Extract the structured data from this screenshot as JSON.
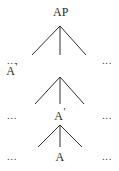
{
  "diagram": {
    "kind": "syntax-tree",
    "width": 119,
    "height": 171,
    "background_color": "#ffffff",
    "text_color": "#2b2b2b",
    "line_color": "#2f2f2f",
    "nodes": [
      {
        "id": "ap",
        "label": "AP",
        "base": "AP",
        "prime": "",
        "x": 61,
        "y": 13
      },
      {
        "id": "a-bar-left",
        "label": "A'",
        "base": "A",
        "prime": "'",
        "x": 12,
        "y": 72
      },
      {
        "id": "a-bar-mid",
        "label": "A'",
        "base": "A",
        "prime": "'",
        "x": 60,
        "y": 117
      },
      {
        "id": "a-head",
        "label": "A",
        "base": "A",
        "prime": "",
        "x": 60,
        "y": 158
      }
    ],
    "ellipses": [
      {
        "id": "ellipsis-left-row1",
        "label": "...",
        "x": 12,
        "y": 61
      },
      {
        "id": "ellipsis-right-row1",
        "label": "...",
        "x": 107,
        "y": 61
      },
      {
        "id": "ellipsis-left-row2",
        "label": "...",
        "x": 12,
        "y": 116
      },
      {
        "id": "ellipsis-right-row2",
        "label": "...",
        "x": 107,
        "y": 116
      },
      {
        "id": "ellipsis-left-row3",
        "label": "...",
        "x": 12,
        "y": 157
      },
      {
        "id": "ellipsis-right-row3",
        "label": "...",
        "x": 107,
        "y": 157
      }
    ],
    "branch_groups": [
      {
        "id": "branch-group-top",
        "apex_x": 60,
        "apex_y": 26,
        "left_x": 32,
        "right_x": 86,
        "bottom_y": 55
      },
      {
        "id": "branch-group-middle",
        "apex_x": 60,
        "apex_y": 77,
        "left_x": 35,
        "right_x": 84,
        "bottom_y": 104
      },
      {
        "id": "branch-group-bottom",
        "apex_x": 60,
        "apex_y": 125,
        "left_x": 38,
        "right_x": 82,
        "bottom_y": 147
      }
    ]
  }
}
